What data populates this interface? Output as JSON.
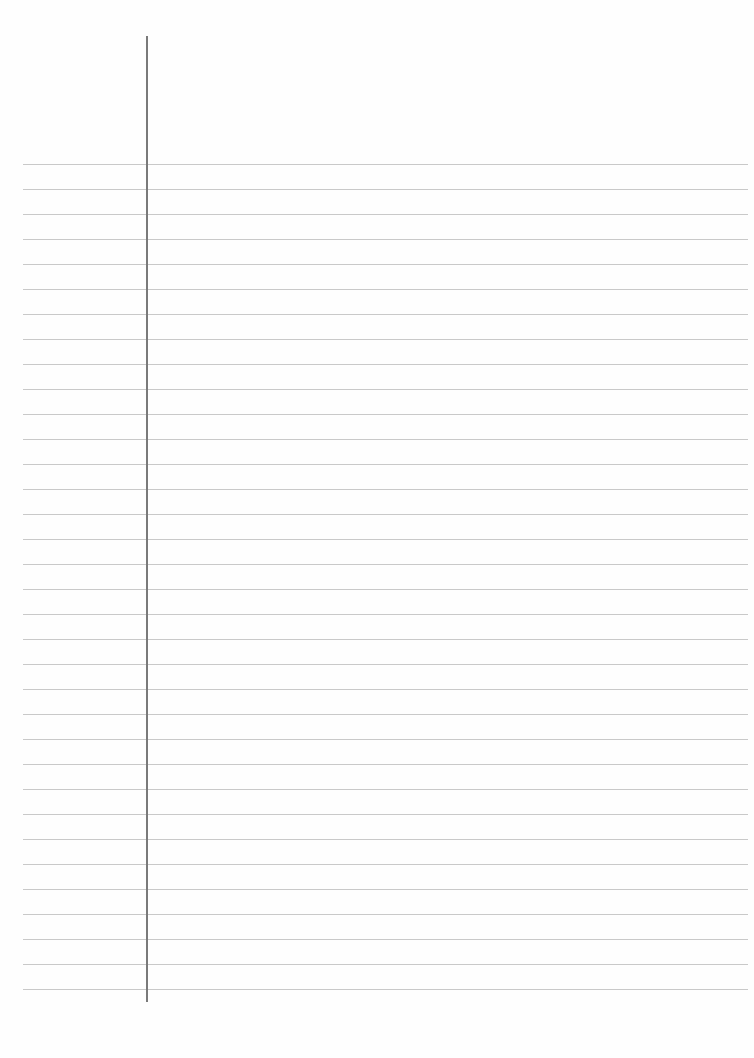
{
  "page": {
    "type": "lined-notebook-paper",
    "background_color": "#fefefe",
    "rule_color": "#c9c9c9",
    "margin_color": "#7a7a7a",
    "content": ""
  },
  "rules": {
    "count": 34,
    "first_y": 164,
    "spacing": 25,
    "left": 23,
    "right": 748
  },
  "margin": {
    "x": 146,
    "top": 36,
    "bottom": 1002
  }
}
